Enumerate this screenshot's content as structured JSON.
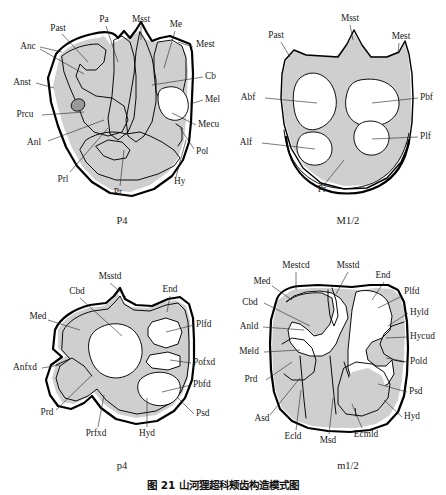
{
  "figure": {
    "caption": "图 21   山河狸超科颊齿构造模式图",
    "caption_number": "图 21",
    "caption_title": "山河狸超科颊齿构造模式图"
  },
  "panels": [
    {
      "id": "P4",
      "name": "P4",
      "position": "top-left",
      "labels": [
        {
          "text": "Past",
          "x": 58,
          "y": 29,
          "anchor": "middle"
        },
        {
          "text": "Pa",
          "x": 104,
          "y": 20,
          "anchor": "middle"
        },
        {
          "text": "Msst",
          "x": 141,
          "y": 20,
          "anchor": "middle"
        },
        {
          "text": "Me",
          "x": 176,
          "y": 25,
          "anchor": "middle"
        },
        {
          "text": "Mest",
          "x": 196,
          "y": 45,
          "anchor": "start"
        },
        {
          "text": "Cb",
          "x": 205,
          "y": 77,
          "anchor": "start"
        },
        {
          "text": "Mel",
          "x": 205,
          "y": 100,
          "anchor": "start"
        },
        {
          "text": "Mecu",
          "x": 198,
          "y": 125,
          "anchor": "start"
        },
        {
          "text": "Pol",
          "x": 196,
          "y": 152,
          "anchor": "start"
        },
        {
          "text": "Hy",
          "x": 174,
          "y": 182,
          "anchor": "start"
        },
        {
          "text": "Anc",
          "x": 28,
          "y": 47,
          "anchor": "middle"
        },
        {
          "text": "Anst",
          "x": 22,
          "y": 83,
          "anchor": "middle"
        },
        {
          "text": "Prcu",
          "x": 25,
          "y": 115,
          "anchor": "middle"
        },
        {
          "text": "Anl",
          "x": 34,
          "y": 143,
          "anchor": "middle"
        },
        {
          "text": "Prl",
          "x": 63,
          "y": 180,
          "anchor": "middle"
        },
        {
          "text": "Pr",
          "x": 118,
          "y": 193,
          "anchor": "middle"
        }
      ]
    },
    {
      "id": "M1/2",
      "name": "M1/2",
      "position": "top-right",
      "labels": [
        {
          "text": "Past",
          "x": 276,
          "y": 36,
          "anchor": "middle"
        },
        {
          "text": "Msst",
          "x": 350,
          "y": 19,
          "anchor": "middle"
        },
        {
          "text": "Mest",
          "x": 401,
          "y": 37,
          "anchor": "middle"
        },
        {
          "text": "Abf",
          "x": 248,
          "y": 98,
          "anchor": "middle"
        },
        {
          "text": "Pbf",
          "x": 420,
          "y": 98,
          "anchor": "start"
        },
        {
          "text": "Alf",
          "x": 246,
          "y": 143,
          "anchor": "middle"
        },
        {
          "text": "Plf",
          "x": 420,
          "y": 137,
          "anchor": "start"
        },
        {
          "text": "Pr",
          "x": 322,
          "y": 190,
          "anchor": "middle"
        }
      ]
    },
    {
      "id": "p4",
      "name": "p4",
      "position": "bottom-left",
      "labels": [
        {
          "text": "Msstd",
          "x": 110,
          "y": 277,
          "anchor": "middle"
        },
        {
          "text": "Cbd",
          "x": 77,
          "y": 292,
          "anchor": "middle"
        },
        {
          "text": "End",
          "x": 170,
          "y": 290,
          "anchor": "middle"
        },
        {
          "text": "Med",
          "x": 38,
          "y": 317,
          "anchor": "middle"
        },
        {
          "text": "Plfd",
          "x": 196,
          "y": 325,
          "anchor": "start"
        },
        {
          "text": "Pofxd",
          "x": 193,
          "y": 363,
          "anchor": "start"
        },
        {
          "text": "Pbfd",
          "x": 193,
          "y": 385,
          "anchor": "start"
        },
        {
          "text": "Anfxd",
          "x": 25,
          "y": 368,
          "anchor": "middle"
        },
        {
          "text": "Psd",
          "x": 196,
          "y": 414,
          "anchor": "start"
        },
        {
          "text": "Prd",
          "x": 47,
          "y": 413,
          "anchor": "middle"
        },
        {
          "text": "Prfxd",
          "x": 96,
          "y": 434,
          "anchor": "middle"
        },
        {
          "text": "Hyd",
          "x": 147,
          "y": 434,
          "anchor": "middle"
        }
      ]
    },
    {
      "id": "m1/2",
      "name": "m1/2",
      "position": "bottom-right",
      "labels": [
        {
          "text": "Mestcd",
          "x": 296,
          "y": 266,
          "anchor": "middle"
        },
        {
          "text": "Msstd",
          "x": 348,
          "y": 266,
          "anchor": "middle"
        },
        {
          "text": "End",
          "x": 383,
          "y": 276,
          "anchor": "middle"
        },
        {
          "text": "Med",
          "x": 262,
          "y": 282,
          "anchor": "middle"
        },
        {
          "text": "Plfd",
          "x": 404,
          "y": 292,
          "anchor": "start"
        },
        {
          "text": "Cbd",
          "x": 250,
          "y": 303,
          "anchor": "middle"
        },
        {
          "text": "Hyld",
          "x": 410,
          "y": 313,
          "anchor": "start"
        },
        {
          "text": "Anld",
          "x": 249,
          "y": 327,
          "anchor": "middle"
        },
        {
          "text": "Hycud",
          "x": 410,
          "y": 337,
          "anchor": "start"
        },
        {
          "text": "Meld",
          "x": 249,
          "y": 352,
          "anchor": "middle"
        },
        {
          "text": "Pold",
          "x": 410,
          "y": 362,
          "anchor": "start"
        },
        {
          "text": "Prd",
          "x": 251,
          "y": 380,
          "anchor": "middle"
        },
        {
          "text": "Psd",
          "x": 409,
          "y": 392,
          "anchor": "start"
        },
        {
          "text": "Asd",
          "x": 262,
          "y": 419,
          "anchor": "middle"
        },
        {
          "text": "Hyd",
          "x": 404,
          "y": 417,
          "anchor": "start"
        },
        {
          "text": "Ecld",
          "x": 293,
          "y": 437,
          "anchor": "middle"
        },
        {
          "text": "Msd",
          "x": 328,
          "y": 441,
          "anchor": "middle"
        },
        {
          "text": "Ecmld",
          "x": 366,
          "y": 435,
          "anchor": "middle"
        }
      ]
    }
  ],
  "colors": {
    "enamel_fill": "#cfcfcf",
    "outline": "#000000",
    "dentine_fill": "#ffffff",
    "label_text": "#1a1a1a",
    "background": "#ffffff"
  }
}
